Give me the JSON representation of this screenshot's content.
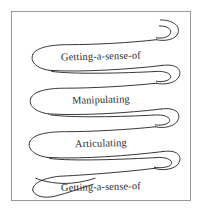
{
  "figure": {
    "title": "",
    "border_color": "#9a9a9a",
    "background_color": "#ffffff",
    "stroke_color": "#1e1e1e",
    "text_color": "#2b2b2b"
  },
  "diagram": {
    "type": "spiral-ribbon",
    "bands": [
      {
        "index": 1,
        "label": "Getting-a-sense-of",
        "turn_side": "right"
      },
      {
        "index": 2,
        "label": "Manipulating",
        "turn_side": "left"
      },
      {
        "index": 3,
        "label": "Articulating",
        "turn_side": "right"
      },
      {
        "index": 4,
        "label": "Getting-a-sense-of",
        "turn_side": "left"
      },
      {
        "index": 5,
        "label": "Manipulating",
        "turn_side": "right"
      }
    ]
  }
}
